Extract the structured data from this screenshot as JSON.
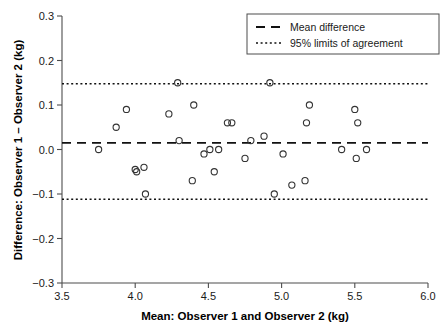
{
  "chart_data": {
    "type": "scatter",
    "title": "",
    "subtitle": "",
    "xlabel": "Mean: Observer 1 and Observer 2 (kg)",
    "ylabel": "Difference: Observer 1 – Observer 2 (kg)",
    "xlim": [
      3.5,
      6.0
    ],
    "ylim": [
      -0.3,
      0.3
    ],
    "xticks": [
      3.5,
      4.0,
      4.5,
      5.0,
      5.5,
      6.0
    ],
    "xtick_labels": [
      "3.5",
      "4.0",
      "4.5",
      "5.0",
      "5.5",
      "6.0"
    ],
    "yticks": [
      0.3,
      0.2,
      0.1,
      0.0,
      -0.1,
      -0.2,
      -0.3
    ],
    "ytick_labels": [
      "0.3",
      "0.2",
      "0.1",
      "0.0",
      "−0.1",
      "−0.2",
      "−0.3"
    ],
    "grid": false,
    "legend_position": "top-right",
    "marker": "open-circle",
    "marker_color": "#333333",
    "reference_lines": [
      {
        "name": "mean-difference",
        "label": "Mean difference",
        "value": 0.015,
        "style": "dashed"
      },
      {
        "name": "upper-limit-of-agreement",
        "label": "95% limits of agreement",
        "value": 0.148,
        "style": "dotted"
      },
      {
        "name": "lower-limit-of-agreement",
        "label": "95% limits of agreement",
        "value": -0.112,
        "style": "dotted"
      }
    ],
    "series": [
      {
        "name": "observer-difference",
        "x": [
          3.75,
          3.87,
          3.94,
          4.0,
          4.01,
          4.06,
          4.07,
          4.23,
          4.29,
          4.3,
          4.39,
          4.4,
          4.47,
          4.51,
          4.54,
          4.57,
          4.63,
          4.66,
          4.75,
          4.79,
          4.88,
          4.92,
          4.95,
          5.01,
          5.07,
          5.16,
          5.17,
          5.19,
          5.41,
          5.5,
          5.51,
          5.52,
          5.58
        ],
        "y": [
          0.0,
          0.05,
          0.09,
          -0.045,
          -0.05,
          -0.04,
          -0.1,
          0.08,
          0.15,
          0.02,
          -0.07,
          0.1,
          -0.01,
          0.0,
          -0.05,
          0.0,
          0.06,
          0.06,
          -0.02,
          0.02,
          0.03,
          0.15,
          -0.1,
          -0.01,
          -0.08,
          -0.07,
          0.06,
          0.1,
          0.0,
          0.09,
          -0.02,
          0.06,
          0.0
        ]
      }
    ]
  },
  "legend": {
    "entries": [
      {
        "label": "Mean difference",
        "style": "dashed"
      },
      {
        "label": "95% limits of agreement",
        "style": "dotted"
      }
    ]
  }
}
